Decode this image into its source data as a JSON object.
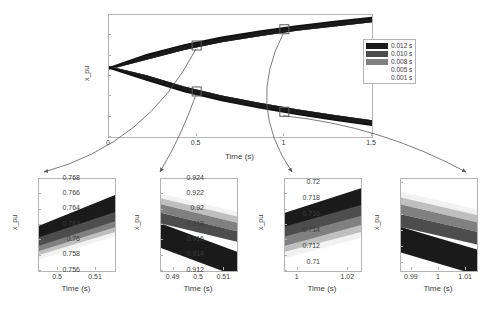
{
  "chart_data": [
    {
      "id": "main",
      "type": "area",
      "title": "",
      "xlabel": "Time (s)",
      "ylabel": "x_pu",
      "xlim": [
        0,
        1.5
      ],
      "ylim": [
        0.65,
        0.95
      ],
      "xticks": [
        "0",
        "0.5",
        "1",
        "1.5"
      ],
      "xtick_values": [
        0,
        0.5,
        1,
        1.5
      ],
      "yticks": [
        "0.65",
        "0.7",
        "0.75",
        "0.8",
        "0.85",
        "0.9",
        "0.95"
      ],
      "ytick_values": [
        0.65,
        0.7,
        0.75,
        0.8,
        0.85,
        0.9,
        0.95
      ],
      "grid": false,
      "legend_position": "right",
      "legend": [
        "0.012 s",
        "0.010 s",
        "0.008 s",
        "0.005 s",
        "0.001 s"
      ],
      "series": [
        {
          "name": "0.012 s",
          "color": "#1a1a1a",
          "upper": [
            0.82,
            0.852,
            0.876,
            0.895,
            0.91,
            0.923,
            0.934,
            0.944
          ],
          "lower": [
            0.82,
            0.79,
            0.762,
            0.74,
            0.722,
            0.706,
            0.692,
            0.679
          ]
        },
        {
          "name": "0.010 s",
          "color": "#4d4d4d",
          "upper": [
            0.82,
            0.85,
            0.874,
            0.893,
            0.908,
            0.921,
            0.932,
            0.942
          ],
          "lower": [
            0.82,
            0.792,
            0.764,
            0.742,
            0.724,
            0.708,
            0.694,
            0.681
          ]
        },
        {
          "name": "0.008 s",
          "color": "#808080",
          "upper": [
            0.82,
            0.848,
            0.872,
            0.891,
            0.906,
            0.919,
            0.93,
            0.94
          ],
          "lower": [
            0.82,
            0.794,
            0.766,
            0.744,
            0.726,
            0.71,
            0.696,
            0.683
          ]
        },
        {
          "name": "0.005 s",
          "color": "#bfbfbf",
          "upper": [
            0.82,
            0.846,
            0.87,
            0.889,
            0.904,
            0.917,
            0.928,
            0.938
          ],
          "lower": [
            0.82,
            0.796,
            0.768,
            0.746,
            0.728,
            0.712,
            0.698,
            0.685
          ]
        },
        {
          "name": "0.001 s",
          "color": "#f2f2f2",
          "upper": [
            0.82,
            0.844,
            0.868,
            0.887,
            0.902,
            0.915,
            0.926,
            0.936
          ],
          "lower": [
            0.82,
            0.798,
            0.77,
            0.748,
            0.73,
            0.714,
            0.7,
            0.687
          ]
        }
      ],
      "markers": [
        {
          "x": 0.5,
          "y": 0.875,
          "label": "inset1"
        },
        {
          "x": 0.5,
          "y": 0.762,
          "label": "inset2"
        },
        {
          "x": 1.0,
          "y": 0.915,
          "label": "inset3"
        },
        {
          "x": 1.0,
          "y": 0.712,
          "label": "inset4"
        }
      ]
    },
    {
      "id": "inset1",
      "type": "area",
      "xlabel": "Time (s)",
      "ylabel": "x_pu",
      "xlim": [
        0.495,
        0.515
      ],
      "ylim": [
        0.87,
        0.882
      ],
      "xticks": [
        "0.5",
        "0.51"
      ],
      "xtick_values": [
        0.5,
        0.51
      ],
      "yticks": [
        "0.87",
        "0.872",
        "0.874",
        "0.876",
        "0.878",
        "0.88",
        "0.882"
      ],
      "ytick_values": [
        0.87,
        0.872,
        0.874,
        0.876,
        0.878,
        0.88,
        0.882
      ],
      "trend": "rising",
      "bands": [
        {
          "name": "0.012 s",
          "color": "#1a1a1a",
          "y_left": 0.8759,
          "y_right": 0.8799,
          "thickness": 0.003
        },
        {
          "name": "0.010 s",
          "color": "#4d4d4d",
          "y_left": 0.8744,
          "y_right": 0.8777,
          "thickness": 0.0014
        },
        {
          "name": "0.008 s",
          "color": "#808080",
          "y_left": 0.8733,
          "y_right": 0.8765,
          "thickness": 0.0011
        },
        {
          "name": "0.005 s",
          "color": "#bfbfbf",
          "y_left": 0.8726,
          "y_right": 0.8757,
          "thickness": 0.0008
        },
        {
          "name": "0.001 s",
          "color": "#f2f2f2",
          "y_left": 0.8721,
          "y_right": 0.8751,
          "thickness": 0.0006
        }
      ]
    },
    {
      "id": "inset2",
      "type": "area",
      "xlabel": "Time (s)",
      "ylabel": "x_pu",
      "xlim": [
        0.485,
        0.515
      ],
      "ylim": [
        0.756,
        0.768
      ],
      "xticks": [
        "0.49",
        "0.5",
        "0.51"
      ],
      "xtick_values": [
        0.49,
        0.5,
        0.51
      ],
      "yticks": [
        "0.756",
        "0.758",
        "0.76",
        "0.762",
        "0.764",
        "0.766",
        "0.768"
      ],
      "ytick_values": [
        0.756,
        0.758,
        0.76,
        0.762,
        0.764,
        0.766,
        0.768
      ],
      "trend": "falling",
      "bands": [
        {
          "name": "0.001 s",
          "color": "#f2f2f2",
          "y_left": 0.7661,
          "y_right": 0.7637,
          "thickness": 0.0006
        },
        {
          "name": "0.005 s",
          "color": "#bfbfbf",
          "y_left": 0.7655,
          "y_right": 0.7631,
          "thickness": 0.0008
        },
        {
          "name": "0.008 s",
          "color": "#808080",
          "y_left": 0.7647,
          "y_right": 0.7623,
          "thickness": 0.0011
        },
        {
          "name": "0.010 s",
          "color": "#4d4d4d",
          "y_left": 0.7636,
          "y_right": 0.7612,
          "thickness": 0.0014
        },
        {
          "name": "0.012 s",
          "color": "#1a1a1a",
          "y_left": 0.7622,
          "y_right": 0.7585,
          "thickness": 0.0032
        }
      ]
    },
    {
      "id": "inset3",
      "type": "area",
      "xlabel": "Time (s)",
      "ylabel": "x_pu",
      "xlim": [
        0.995,
        1.025
      ],
      "ylim": [
        0.912,
        0.924
      ],
      "xticks": [
        "1",
        "1.02"
      ],
      "xtick_values": [
        1,
        1.02
      ],
      "yticks": [
        "0.912",
        "0.914",
        "0.916",
        "0.918",
        "0.92",
        "0.922",
        "0.924"
      ],
      "ytick_values": [
        0.912,
        0.914,
        0.916,
        0.918,
        0.92,
        0.922,
        0.924
      ],
      "trend": "rising",
      "bands": [
        {
          "name": "0.012 s",
          "color": "#1a1a1a",
          "y_left": 0.9196,
          "y_right": 0.9228,
          "thickness": 0.0032
        },
        {
          "name": "0.010 s",
          "color": "#4d4d4d",
          "y_left": 0.9178,
          "y_right": 0.9206,
          "thickness": 0.0016
        },
        {
          "name": "0.008 s",
          "color": "#808080",
          "y_left": 0.9165,
          "y_right": 0.9192,
          "thickness": 0.0013
        },
        {
          "name": "0.005 s",
          "color": "#bfbfbf",
          "y_left": 0.9153,
          "y_right": 0.918,
          "thickness": 0.001
        },
        {
          "name": "0.001 s",
          "color": "#f2f2f2",
          "y_left": 0.9145,
          "y_right": 0.9171,
          "thickness": 0.0008
        }
      ]
    },
    {
      "id": "inset4",
      "type": "area",
      "xlabel": "Time (s)",
      "ylabel": "x_pu",
      "xlim": [
        0.986,
        1.014
      ],
      "ylim": [
        0.709,
        0.7205
      ],
      "xticks": [
        "0.99",
        "1",
        "1.01"
      ],
      "xtick_values": [
        0.99,
        1,
        1.01
      ],
      "yticks": [
        "0.71",
        "0.712",
        "0.714",
        "0.716",
        "0.718",
        "0.72"
      ],
      "ytick_values": [
        0.71,
        0.712,
        0.714,
        0.716,
        0.718,
        0.72
      ],
      "trend": "falling",
      "bands": [
        {
          "name": "0.001 s",
          "color": "#f2f2f2",
          "y_left": 0.7189,
          "y_right": 0.7167,
          "thickness": 0.0007
        },
        {
          "name": "0.005 s",
          "color": "#bfbfbf",
          "y_left": 0.7182,
          "y_right": 0.716,
          "thickness": 0.0009
        },
        {
          "name": "0.008 s",
          "color": "#808080",
          "y_left": 0.7173,
          "y_right": 0.7151,
          "thickness": 0.0012
        },
        {
          "name": "0.010 s",
          "color": "#4d4d4d",
          "y_left": 0.7161,
          "y_right": 0.7139,
          "thickness": 0.0016
        },
        {
          "name": "0.012 s",
          "color": "#1a1a1a",
          "y_left": 0.7145,
          "y_right": 0.7117,
          "thickness": 0.0032
        }
      ]
    }
  ],
  "legend": {
    "entries": [
      {
        "label": "0.012 s",
        "color": "#1a1a1a",
        "swatch": true
      },
      {
        "label": "0.010 s",
        "color": "#4d4d4d",
        "swatch": true
      },
      {
        "label": "0.008 s",
        "color": "#808080",
        "swatch": true
      },
      {
        "label": "0.005 s",
        "color": "#d9d9d9",
        "swatch": false
      },
      {
        "label": "0.001 s",
        "color": "#fafafa",
        "swatch": false
      }
    ]
  },
  "annotations": {
    "arrow_color": "#5a5a5a",
    "marker_color": "#5a5a5a"
  }
}
